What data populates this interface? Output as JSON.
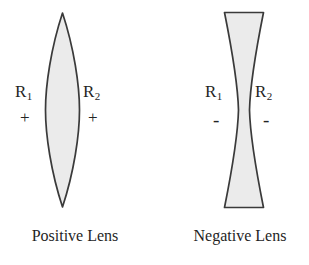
{
  "figure": {
    "background_color": "#ffffff",
    "outline_color": "#3a3a3a",
    "fill_color": "#ebebeb",
    "text_color": "#242424"
  },
  "lenses": [
    {
      "id": "positive",
      "caption": "Positive Lens",
      "shape": "biconvex",
      "surfaces": [
        {
          "label": "R",
          "subscript": "1",
          "sign": "+"
        },
        {
          "label": "R",
          "subscript": "2",
          "sign": "+"
        }
      ]
    },
    {
      "id": "negative",
      "caption": "Negative Lens",
      "shape": "biconcave",
      "surfaces": [
        {
          "label": "R",
          "subscript": "1",
          "sign": "-"
        },
        {
          "label": "R",
          "subscript": "2",
          "sign": "-"
        }
      ]
    }
  ],
  "icons": {
    "positive_lens_shape": "biconvex-lens-icon",
    "negative_lens_shape": "biconcave-lens-icon"
  }
}
